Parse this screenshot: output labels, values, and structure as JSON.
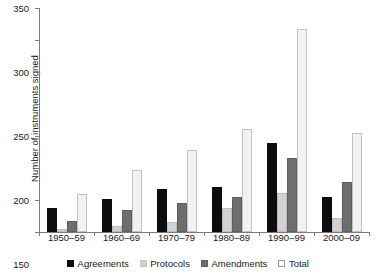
{
  "chart_data": {
    "type": "bar",
    "title": "",
    "xlabel": "",
    "ylabel": "Number of  instruments signed",
    "categories": [
      "1950–59",
      "1960–69",
      "1970–79",
      "1980–89",
      "1990–99",
      "2000–09"
    ],
    "series": [
      {
        "name": "Agreements",
        "color": "#0d0d0d",
        "values": [
          37,
          51,
          67,
          70,
          139,
          55
        ]
      },
      {
        "name": "Protocols",
        "color": "#d2d2d2",
        "values": [
          5,
          10,
          16,
          37,
          61,
          22
        ]
      },
      {
        "name": "Amendments",
        "color": "#6e6e6e",
        "values": [
          17,
          34,
          45,
          55,
          115,
          78
        ]
      },
      {
        "name": "Total",
        "color": "#f2f2f2",
        "values": [
          59,
          97,
          128,
          161,
          317,
          155
        ]
      }
    ],
    "ylim": [
      0,
      350
    ],
    "yticks": [
      0,
      50,
      100,
      150,
      200,
      250,
      300,
      350
    ],
    "ytick_labels": [
      "0",
      "50",
      "100",
      "150",
      "200",
      "250",
      "300",
      "350"
    ],
    "grid": false,
    "legend_position": "bottom"
  }
}
